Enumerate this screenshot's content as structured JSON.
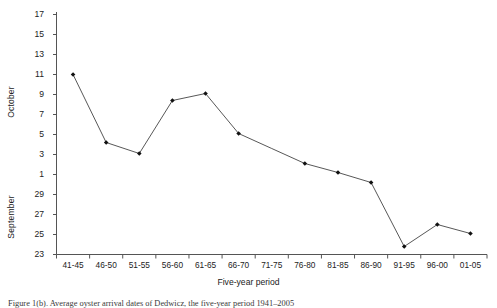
{
  "figure": {
    "caption": "Figure 1(b). Average oyster arrival dates of Dedwicz, the five-year period 1941–2005",
    "xtitle": "Five-year period",
    "y_axis_titles": {
      "upper": "October",
      "lower": "September"
    },
    "y_tick_labels": [
      "17",
      "15",
      "13",
      "11",
      "9",
      "7",
      "5",
      "3",
      "1",
      "29",
      "27",
      "25",
      "23"
    ],
    "x_tick_labels": [
      "41-45",
      "46-50",
      "51-55",
      "56-60",
      "61-65",
      "66-70",
      "71-75",
      "76-80",
      "81-85",
      "86-90",
      "91-95",
      "96-00",
      "01-05"
    ]
  },
  "chart_data": {
    "type": "line",
    "title": "",
    "xlabel": "Five-year period",
    "ylabel": "October / September",
    "grid": false,
    "legend": null,
    "marker": "filled-diamond",
    "line_color": "#444444",
    "marker_color": "#111111",
    "categories": [
      "41-45",
      "46-50",
      "51-55",
      "56-60",
      "61-65",
      "66-70",
      "71-75",
      "76-80",
      "81-85",
      "86-90",
      "91-95",
      "96-00",
      "01-05"
    ],
    "y_tick_values": [
      17,
      15,
      13,
      11,
      9,
      7,
      5,
      3,
      1,
      29,
      27,
      25,
      23
    ],
    "y_axis_note": "Continuous date scale running from 23 September (bottom) through 1 October up to 17 October (top); September values 23-29 occupy the lower portion.",
    "ylim_scale": [
      23,
      47
    ],
    "values_scale": [
      41,
      34.2,
      33.1,
      38.4,
      39.1,
      35.1,
      null,
      32.1,
      31.2,
      30.2,
      23.8,
      26.0,
      25.1
    ],
    "values_labeled": [
      "11 Oct",
      "4 Oct",
      "3 Oct",
      "8 Oct",
      "9 Oct",
      "5 Oct",
      null,
      "2 Oct",
      "1 Oct",
      "30 Sep",
      "24 Sep",
      "26 Sep",
      "25 Sep"
    ],
    "missing_marker_categories": [
      "71-75"
    ]
  },
  "colors": {
    "axis": "#555555",
    "line": "#444444",
    "marker": "#111111",
    "text": "#232323",
    "background": "#ffffff"
  }
}
